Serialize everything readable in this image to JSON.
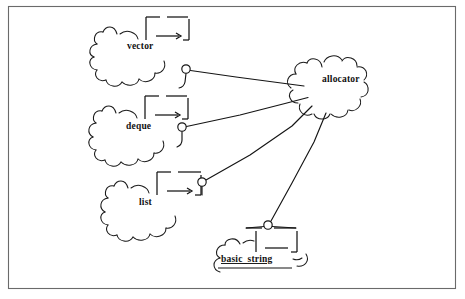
{
  "figure": {
    "title": "",
    "kind": "uml-package-dependency-diagram",
    "frame": {
      "visible": true,
      "color": "#6a6a6a"
    },
    "background_color": "#ffffff",
    "ink_color": "#141414"
  },
  "nodes": [
    {
      "id": "vector",
      "label": "vector",
      "icon": "package-cloud-icon",
      "underlined": false,
      "label_x": 127,
      "label_y": 49,
      "socket": {
        "cx": 186,
        "cy": 69,
        "r": 4.2
      }
    },
    {
      "id": "deque",
      "label": "deque",
      "icon": "package-cloud-icon",
      "underlined": false,
      "label_x": 126,
      "label_y": 129,
      "socket": {
        "cx": 182,
        "cy": 127,
        "r": 4.2
      }
    },
    {
      "id": "list",
      "label": "list",
      "icon": "package-cloud-icon",
      "underlined": false,
      "label_x": 139,
      "label_y": 205,
      "socket": {
        "cx": 202,
        "cy": 182,
        "r": 4.2
      }
    },
    {
      "id": "basic_string",
      "label": "basic_string",
      "icon": "package-cloud-icon",
      "underlined": true,
      "label_x": 221,
      "label_y": 262,
      "socket": {
        "cx": 268,
        "cy": 225,
        "r": 4.2
      }
    },
    {
      "id": "allocator",
      "label": "allocator",
      "icon": "package-cloud-icon",
      "underlined": false,
      "label_x": 322,
      "label_y": 82,
      "socket": null
    }
  ],
  "edges": [
    {
      "from": "vector",
      "to": "allocator",
      "style": "solid"
    },
    {
      "from": "deque",
      "to": "allocator",
      "style": "solid"
    },
    {
      "from": "list",
      "to": "allocator",
      "style": "solid"
    },
    {
      "from": "basic_string",
      "to": "allocator",
      "style": "solid"
    }
  ]
}
